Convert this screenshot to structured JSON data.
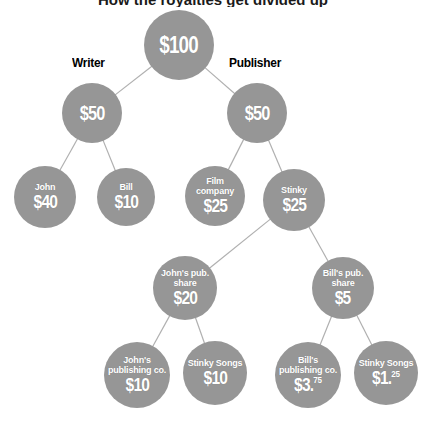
{
  "diagram": {
    "title_cropped": "How the royalties get divided up",
    "background_color": "#ffffff",
    "node_color": "#969696",
    "node_text_color": "#ffffff",
    "edge_color": "#b0b0b0",
    "label_color": "#000000",
    "side_labels": [
      {
        "id": "writer",
        "text": "Writer",
        "x": 72,
        "y": 55
      },
      {
        "id": "publisher",
        "text": "Publisher",
        "x": 229,
        "y": 55
      }
    ],
    "nodes": [
      {
        "id": "total",
        "name": "",
        "amount": "$100",
        "cents": "",
        "cx": 179,
        "cy": 45,
        "r": 35,
        "name_font": 0,
        "amount_font": 23
      },
      {
        "id": "writer-share",
        "name": "",
        "amount": "$50",
        "cents": "",
        "cx": 92,
        "cy": 113,
        "r": 30,
        "name_font": 0,
        "amount_font": 20
      },
      {
        "id": "publisher-share",
        "name": "",
        "amount": "$50",
        "cents": "",
        "cx": 257,
        "cy": 113,
        "r": 30,
        "name_font": 0,
        "amount_font": 20
      },
      {
        "id": "john",
        "name": "John",
        "amount": "$40",
        "cents": "",
        "cx": 45,
        "cy": 197,
        "r": 31,
        "name_font": 9,
        "amount_font": 19
      },
      {
        "id": "bill",
        "name": "Bill",
        "amount": "$10",
        "cents": "",
        "cx": 126,
        "cy": 197,
        "r": 29,
        "name_font": 9,
        "amount_font": 19
      },
      {
        "id": "film-company",
        "name": "Film company",
        "amount": "$25",
        "cents": "",
        "cx": 215,
        "cy": 196,
        "r": 30,
        "name_font": 9,
        "amount_font": 19
      },
      {
        "id": "stinky",
        "name": "Stinky",
        "amount": "$25",
        "cents": "",
        "cx": 294,
        "cy": 200,
        "r": 31,
        "name_font": 9,
        "amount_font": 19
      },
      {
        "id": "johns-pub-share",
        "name": "John's pub. share",
        "amount": "$20",
        "cents": "",
        "cx": 185,
        "cy": 288,
        "r": 32,
        "name_font": 9,
        "amount_font": 19
      },
      {
        "id": "bills-pub-share",
        "name": "Bill's pub. share",
        "amount": "$5",
        "cents": "",
        "cx": 343,
        "cy": 288,
        "r": 31,
        "name_font": 9,
        "amount_font": 19
      },
      {
        "id": "johns-pub-co",
        "name": "John's publishing co.",
        "amount": "$10",
        "cents": "",
        "cx": 137,
        "cy": 375,
        "r": 33,
        "name_font": 9,
        "amount_font": 19
      },
      {
        "id": "stinky-songs-10",
        "name": "Stinky Songs",
        "amount": "$10",
        "cents": "",
        "cx": 215,
        "cy": 373,
        "r": 32,
        "name_font": 9,
        "amount_font": 19
      },
      {
        "id": "bills-pub-co",
        "name": "Bill's publishing co.",
        "amount": "$3.",
        "cents": "75",
        "cx": 308,
        "cy": 375,
        "r": 33,
        "name_font": 9,
        "amount_font": 19
      },
      {
        "id": "stinky-songs-125",
        "name": "Stinky Songs",
        "amount": "$1.",
        "cents": "25",
        "cx": 386,
        "cy": 373,
        "r": 32,
        "name_font": 9,
        "amount_font": 19
      }
    ],
    "edges": [
      {
        "from": "total",
        "to": "writer-share"
      },
      {
        "from": "total",
        "to": "publisher-share"
      },
      {
        "from": "writer-share",
        "to": "john"
      },
      {
        "from": "writer-share",
        "to": "bill"
      },
      {
        "from": "publisher-share",
        "to": "film-company"
      },
      {
        "from": "publisher-share",
        "to": "stinky"
      },
      {
        "from": "stinky",
        "to": "johns-pub-share"
      },
      {
        "from": "stinky",
        "to": "bills-pub-share"
      },
      {
        "from": "johns-pub-share",
        "to": "johns-pub-co"
      },
      {
        "from": "johns-pub-share",
        "to": "stinky-songs-10"
      },
      {
        "from": "bills-pub-share",
        "to": "bills-pub-co"
      },
      {
        "from": "bills-pub-share",
        "to": "stinky-songs-125"
      }
    ]
  }
}
